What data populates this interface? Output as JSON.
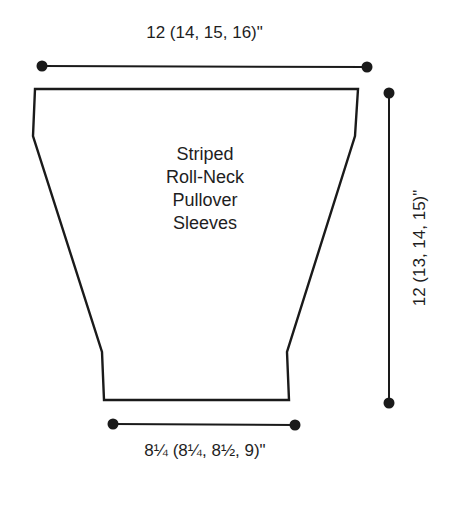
{
  "diagram": {
    "type": "knitting-schematic",
    "piece_title_lines": [
      "Striped",
      "Roll-Neck",
      "Pullover",
      "Sleeves"
    ],
    "measurements": {
      "top_width": "12 (14, 15, 16)\"",
      "length": "12 (13, 14, 15)\"",
      "cuff_width": "8¼ (8¼, 8½, 9)\""
    },
    "colors": {
      "line": "#1a1a1a",
      "background": "#ffffff"
    }
  }
}
